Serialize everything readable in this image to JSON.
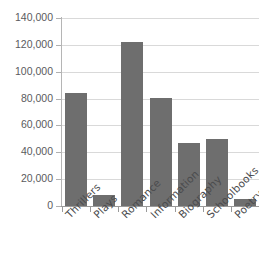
{
  "chart_data": {
    "type": "bar",
    "title": "",
    "subtitle": "",
    "xlabel": "",
    "ylabel": "",
    "categories": [
      "Thrillers",
      "Plays",
      "Romance",
      "Information",
      "Biography",
      "Schoolbooks",
      "Poetry"
    ],
    "values": [
      84000,
      8000,
      122000,
      80500,
      47000,
      50000,
      5000
    ],
    "series": [
      {
        "name": "Books sold",
        "values": [
          84000,
          8000,
          122000,
          80500,
          47000,
          50000,
          5000
        ]
      }
    ],
    "ylim": [
      0,
      140000
    ],
    "ytick_values": [
      0,
      20000,
      40000,
      60000,
      80000,
      100000,
      120000,
      140000
    ],
    "ytick_labels": [
      "0",
      "20,000",
      "40,000",
      "60,000",
      "80,000",
      "100,000",
      "120,000",
      "140,000"
    ],
    "grid": true,
    "grid_axis": "y",
    "legend": false,
    "legend_position": "none",
    "bar_color": "#6e6e6e",
    "gridline_color": "#d9d9d9",
    "axis_color": "#9a9a9a",
    "tick_label_color": "#5a5b5d",
    "background_color": "#ffffff"
  }
}
